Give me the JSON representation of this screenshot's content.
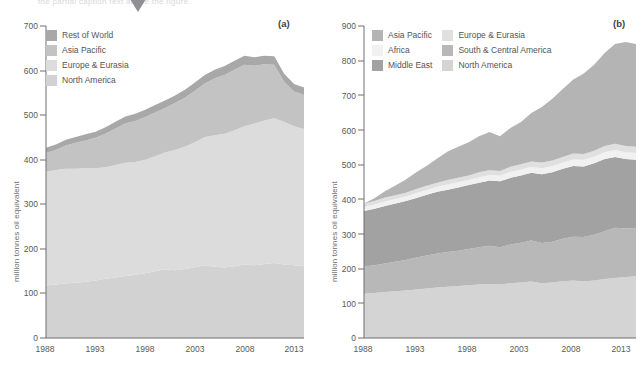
{
  "figure": {
    "cut_caption": "the partial caption text above the figure",
    "marker": "triangle-down"
  },
  "panel_a": {
    "label": "(a)",
    "ylabel": "million tonnes oil equivalent",
    "yticks": [
      "0",
      "100",
      "200",
      "300",
      "400",
      "500",
      "600",
      "700"
    ],
    "xticks": [
      "1988",
      "1993",
      "1998",
      "2003",
      "2008",
      "2013"
    ],
    "legend": [
      {
        "label": "Rest of World",
        "color": "#a8a8a8"
      },
      {
        "label": "Asia Pacific",
        "color": "#c3c3c3"
      },
      {
        "label": "Europe & Eurasia",
        "color": "#dcdcdc"
      },
      {
        "label": "North America",
        "color": "#d2d2d2"
      }
    ]
  },
  "panel_b": {
    "label": "(b)",
    "ylabel": "million tonnes oil equivalent",
    "yticks": [
      "0",
      "100",
      "200",
      "300",
      "400",
      "500",
      "600",
      "700",
      "800",
      "900"
    ],
    "xticks": [
      "1988",
      "1993",
      "1998",
      "2003",
      "2008",
      "2013"
    ],
    "legend": [
      {
        "label": "Asia Pacific",
        "color": "#b4b4b4"
      },
      {
        "label": "Europe & Eurasia",
        "color": "#e0e0e0"
      },
      {
        "label": "Africa",
        "color": "#f1f1f1"
      },
      {
        "label": "South & Central America",
        "color": "#b8b8b8"
      },
      {
        "label": "Middle East",
        "color": "#a2a2a2"
      },
      {
        "label": "North America",
        "color": "#d4d4d4"
      }
    ]
  },
  "chart_data": [
    {
      "type": "area",
      "title": "(a)",
      "stacked": true,
      "xlabel": "",
      "ylabel": "million tonnes oil equivalent",
      "ylim": [
        0,
        700
      ],
      "xlim": [
        1988,
        2014
      ],
      "grid": false,
      "legend_position": "top-left",
      "x": [
        1988,
        1989,
        1990,
        1991,
        1992,
        1993,
        1994,
        1995,
        1996,
        1997,
        1998,
        1999,
        2000,
        2001,
        2002,
        2003,
        2004,
        2005,
        2006,
        2007,
        2008,
        2009,
        2010,
        2011,
        2012,
        2013,
        2014
      ],
      "series": [
        {
          "name": "North America",
          "color": "#d2d2d2",
          "values": [
            118,
            120,
            122,
            124,
            126,
            129,
            133,
            136,
            139,
            142,
            145,
            150,
            154,
            152,
            155,
            159,
            163,
            160,
            158,
            161,
            165,
            163,
            166,
            168,
            165,
            163,
            161
          ]
        },
        {
          "name": "Europe & Eurasia",
          "color": "#dcdcdc",
          "values": [
            255,
            257,
            258,
            256,
            255,
            252,
            250,
            252,
            254,
            253,
            255,
            258,
            262,
            270,
            274,
            280,
            288,
            295,
            300,
            305,
            310,
            318,
            322,
            325,
            320,
            312,
            308
          ]
        },
        {
          "name": "Asia Pacific",
          "color": "#c3c3c3",
          "values": [
            42,
            45,
            52,
            58,
            62,
            68,
            75,
            82,
            88,
            92,
            96,
            98,
            100,
            105,
            110,
            116,
            120,
            128,
            132,
            136,
            138,
            130,
            126,
            120,
            90,
            78,
            76
          ]
        },
        {
          "name": "Rest of World",
          "color": "#a8a8a8",
          "values": [
            12,
            12,
            13,
            13,
            14,
            14,
            15,
            15,
            16,
            16,
            16,
            17,
            17,
            17,
            18,
            18,
            19,
            19,
            20,
            20,
            20,
            19,
            19,
            19,
            18,
            17,
            17
          ]
        }
      ],
      "total_top_values": [
        427,
        434,
        445,
        451,
        457,
        463,
        473,
        485,
        497,
        503,
        512,
        523,
        533,
        544,
        557,
        573,
        590,
        602,
        610,
        622,
        633,
        630,
        633,
        632,
        593,
        570,
        562
      ],
      "notes": "Stacked area, bottom-to-top order: North America, Europe & Eurasia, Asia Pacific, Rest of World. Total rises from ~427 in 1988 to a peak of ~633 around 2008-2011 then falls to ~555 by 2014."
    },
    {
      "type": "area",
      "title": "(b)",
      "stacked": true,
      "xlabel": "",
      "ylabel": "million tonnes oil equivalent",
      "ylim": [
        0,
        900
      ],
      "xlim": [
        1988,
        2014
      ],
      "grid": false,
      "legend_position": "top-left",
      "x": [
        1988,
        1989,
        1990,
        1991,
        1992,
        1993,
        1994,
        1995,
        1996,
        1997,
        1998,
        1999,
        2000,
        2001,
        2002,
        2003,
        2004,
        2005,
        2006,
        2007,
        2008,
        2009,
        2010,
        2011,
        2012,
        2013,
        2014
      ],
      "series": [
        {
          "name": "North America",
          "color": "#d4d4d4",
          "values": [
            128,
            130,
            133,
            135,
            137,
            140,
            143,
            146,
            148,
            150,
            152,
            154,
            156,
            154,
            158,
            160,
            163,
            158,
            160,
            164,
            166,
            163,
            166,
            170,
            173,
            176,
            178
          ]
        },
        {
          "name": "South & Central America",
          "color": "#b8b8b8",
          "values": [
            78,
            80,
            82,
            85,
            88,
            92,
            95,
            98,
            100,
            102,
            105,
            108,
            110,
            108,
            112,
            115,
            118,
            116,
            118,
            122,
            126,
            128,
            132,
            138,
            145,
            140,
            138
          ]
        },
        {
          "name": "Middle East",
          "color": "#a2a2a2",
          "values": [
            160,
            163,
            166,
            168,
            170,
            172,
            175,
            178,
            180,
            182,
            184,
            186,
            188,
            190,
            192,
            194,
            196,
            198,
            200,
            202,
            204,
            204,
            206,
            208,
            204,
            200,
            198
          ]
        },
        {
          "name": "Africa",
          "color": "#f1f1f1",
          "values": [
            12,
            12,
            13,
            13,
            13,
            14,
            14,
            14,
            15,
            15,
            15,
            16,
            16,
            16,
            17,
            17,
            17,
            18,
            18,
            18,
            19,
            19,
            19,
            20,
            20,
            20,
            20
          ]
        },
        {
          "name": "Europe & Eurasia",
          "color": "#e0e0e0",
          "values": [
            10,
            10,
            11,
            11,
            11,
            12,
            12,
            12,
            13,
            13,
            13,
            14,
            14,
            14,
            15,
            15,
            15,
            16,
            16,
            16,
            17,
            17,
            17,
            18,
            18,
            18,
            18
          ]
        },
        {
          "name": "Asia Pacific",
          "color": "#b4b4b4",
          "values": [
            0,
            8,
            18,
            28,
            38,
            48,
            58,
            70,
            82,
            90,
            96,
            104,
            110,
            100,
            112,
            122,
            140,
            160,
            178,
            196,
            214,
            232,
            248,
            268,
            288,
            300,
            296
          ]
        }
      ],
      "total_top_values": [
        388,
        403,
        423,
        440,
        457,
        478,
        497,
        518,
        538,
        552,
        565,
        582,
        594,
        582,
        606,
        623,
        649,
        666,
        690,
        718,
        746,
        763,
        788,
        822,
        848,
        854,
        848
      ],
      "notes": "Stacked area, bottom-to-top order: North America, South & Central America, Middle East, Africa (thin pale band), Europe & Eurasia (thin), Asia Pacific (top, growing strongly). Total rises steadily from ~388 in 1988 to ~850 by 2014."
    }
  ]
}
